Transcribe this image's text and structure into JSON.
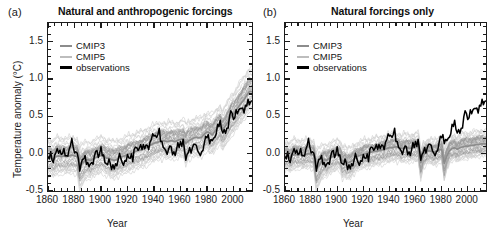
{
  "figure": {
    "width": 499,
    "height": 238,
    "background": "#ffffff"
  },
  "colors": {
    "cmip3": "#8c8c8c",
    "cmip5": "#bdbdbd",
    "observations": "#000000",
    "cmip3_spread": "#9a9a9a",
    "cmip5_spread": "#cfcfcf",
    "axis": "#1b1b1b",
    "text": "#1a1a1a"
  },
  "panels": [
    {
      "id": "a",
      "label": "(a)",
      "title": "Natural and anthropogenic forcings"
    },
    {
      "id": "b",
      "label": "(b)",
      "title": "Natural forcings only"
    }
  ],
  "axes": {
    "xlabel": "Year",
    "ylabel": "Temperature anomaly (°C)",
    "xlim": [
      1860,
      2014
    ],
    "ylim": [
      -0.5,
      1.75
    ],
    "xticks": [
      1860,
      1880,
      1900,
      1920,
      1940,
      1960,
      1980,
      2000
    ],
    "xtick_labels": [
      "1860",
      "1880",
      "1900",
      "1920",
      "1940",
      "1960",
      "1980",
      "2000"
    ],
    "xminor_step": 5,
    "yticks": [
      -0.5,
      0.0,
      0.5,
      1.0,
      1.5
    ],
    "ytick_labels": [
      "-0.5",
      "0.0",
      "0.5",
      "1.0",
      "1.5"
    ],
    "yminor_step": 0.1,
    "grid": false
  },
  "legend": {
    "position": "upper-left",
    "entries": [
      {
        "label": "CMIP3",
        "color": "#8c8c8c"
      },
      {
        "label": "CMIP5",
        "color": "#bdbdbd"
      },
      {
        "label": "observations",
        "color": "#000000"
      }
    ]
  },
  "chart_data": {
    "type": "line",
    "xlabel": "Year",
    "ylabel": "Temperature anomaly (°C)",
    "xlim": [
      1860,
      2014
    ],
    "ylim": [
      -0.5,
      1.75
    ],
    "grid": false,
    "legend_position": "upper-left",
    "note": "Anomalies relative to the 1880-1919 reference period. Shaded bands show the 5-95% range of the CMIP3 and CMIP5 multi-model ensembles.",
    "x": [
      1860,
      1862,
      1864,
      1866,
      1868,
      1870,
      1872,
      1874,
      1876,
      1878,
      1880,
      1882,
      1884,
      1886,
      1888,
      1890,
      1892,
      1894,
      1896,
      1898,
      1900,
      1902,
      1904,
      1906,
      1908,
      1910,
      1912,
      1914,
      1916,
      1918,
      1920,
      1922,
      1924,
      1926,
      1928,
      1930,
      1932,
      1934,
      1936,
      1938,
      1940,
      1942,
      1944,
      1946,
      1948,
      1950,
      1952,
      1954,
      1956,
      1958,
      1960,
      1962,
      1964,
      1966,
      1968,
      1970,
      1972,
      1974,
      1976,
      1978,
      1980,
      1982,
      1984,
      1986,
      1988,
      1990,
      1992,
      1994,
      1996,
      1998,
      2000,
      2002,
      2004,
      2006,
      2008,
      2010,
      2012
    ],
    "panels": [
      {
        "id": "a",
        "title": "Natural and anthropogenic forcings",
        "series": [
          {
            "name": "observations",
            "color": "#000000",
            "values": [
              -0.08,
              0.02,
              -0.14,
              0.05,
              0.02,
              -0.02,
              0.06,
              -0.05,
              0.04,
              0.18,
              0.02,
              0.01,
              -0.22,
              -0.09,
              -0.05,
              -0.17,
              -0.16,
              -0.14,
              0.03,
              -0.06,
              0.06,
              -0.07,
              -0.16,
              -0.08,
              -0.2,
              -0.21,
              -0.18,
              0.0,
              -0.16,
              -0.12,
              -0.05,
              -0.05,
              -0.08,
              0.1,
              0.04,
              0.06,
              0.06,
              0.08,
              0.06,
              0.19,
              0.22,
              0.18,
              0.28,
              0.1,
              0.04,
              -0.03,
              0.11,
              -0.02,
              -0.06,
              0.12,
              0.1,
              0.13,
              -0.08,
              0.02,
              0.0,
              0.11,
              0.06,
              -0.03,
              -0.04,
              0.14,
              0.23,
              0.15,
              0.14,
              0.21,
              0.33,
              0.38,
              0.28,
              0.29,
              0.33,
              0.58,
              0.43,
              0.53,
              0.57,
              0.6,
              0.55,
              0.67,
              0.68
            ]
          },
          {
            "name": "CMIP3",
            "color": "#8c8c8c",
            "values": [
              -0.06,
              -0.05,
              -0.08,
              -0.04,
              -0.03,
              -0.04,
              -0.03,
              -0.04,
              -0.03,
              -0.02,
              -0.03,
              -0.04,
              -0.16,
              -0.13,
              -0.09,
              -0.08,
              -0.09,
              -0.07,
              -0.05,
              -0.04,
              -0.02,
              -0.03,
              -0.06,
              -0.06,
              -0.08,
              -0.09,
              -0.08,
              -0.05,
              -0.04,
              -0.03,
              -0.01,
              0.0,
              0.01,
              0.03,
              0.04,
              0.05,
              0.06,
              0.08,
              0.1,
              0.12,
              0.14,
              0.15,
              0.16,
              0.17,
              0.17,
              0.16,
              0.17,
              0.17,
              0.16,
              0.18,
              0.19,
              0.2,
              0.14,
              0.17,
              0.19,
              0.21,
              0.22,
              0.21,
              0.22,
              0.26,
              0.29,
              0.28,
              0.25,
              0.3,
              0.35,
              0.38,
              0.33,
              0.37,
              0.43,
              0.5,
              0.53,
              0.58,
              0.63,
              0.68,
              0.72,
              0.78,
              0.83
            ]
          },
          {
            "name": "CMIP5",
            "color": "#bdbdbd",
            "values": [
              -0.05,
              -0.04,
              -0.07,
              -0.03,
              -0.02,
              -0.03,
              -0.02,
              -0.03,
              -0.02,
              -0.01,
              -0.02,
              -0.03,
              -0.18,
              -0.14,
              -0.1,
              -0.08,
              -0.09,
              -0.06,
              -0.04,
              -0.03,
              -0.01,
              -0.02,
              -0.05,
              -0.05,
              -0.07,
              -0.08,
              -0.07,
              -0.04,
              -0.03,
              -0.02,
              0.0,
              0.01,
              0.02,
              0.04,
              0.05,
              0.06,
              0.07,
              0.09,
              0.11,
              0.13,
              0.15,
              0.16,
              0.17,
              0.18,
              0.18,
              0.17,
              0.18,
              0.18,
              0.17,
              0.19,
              0.2,
              0.21,
              0.13,
              0.18,
              0.2,
              0.22,
              0.23,
              0.22,
              0.23,
              0.27,
              0.3,
              0.27,
              0.26,
              0.31,
              0.36,
              0.39,
              0.32,
              0.38,
              0.44,
              0.51,
              0.55,
              0.6,
              0.65,
              0.7,
              0.75,
              0.8,
              0.86
            ]
          }
        ],
        "spread": {
          "cmip5_lower": [
            -0.3,
            -0.29,
            -0.32,
            -0.28,
            -0.27,
            -0.28,
            -0.27,
            -0.28,
            -0.27,
            -0.26,
            -0.27,
            -0.28,
            -0.52,
            -0.46,
            -0.38,
            -0.33,
            -0.34,
            -0.31,
            -0.29,
            -0.28,
            -0.26,
            -0.27,
            -0.3,
            -0.3,
            -0.36,
            -0.34,
            -0.32,
            -0.29,
            -0.28,
            -0.27,
            -0.25,
            -0.24,
            -0.23,
            -0.21,
            -0.2,
            -0.19,
            -0.18,
            -0.16,
            -0.14,
            -0.12,
            -0.1,
            -0.09,
            -0.08,
            -0.07,
            -0.07,
            -0.08,
            -0.07,
            -0.07,
            -0.08,
            -0.06,
            -0.05,
            -0.04,
            -0.18,
            -0.09,
            -0.07,
            -0.05,
            -0.04,
            -0.05,
            -0.04,
            0.0,
            0.03,
            -0.04,
            -0.02,
            0.04,
            0.09,
            0.12,
            0.0,
            0.09,
            0.15,
            0.22,
            0.26,
            0.31,
            0.36,
            0.41,
            0.46,
            0.51,
            0.57
          ],
          "cmip5_upper": [
            0.2,
            0.21,
            0.18,
            0.22,
            0.23,
            0.22,
            0.23,
            0.22,
            0.23,
            0.24,
            0.23,
            0.22,
            0.1,
            0.13,
            0.16,
            0.18,
            0.17,
            0.2,
            0.22,
            0.23,
            0.25,
            0.24,
            0.21,
            0.21,
            0.19,
            0.18,
            0.19,
            0.22,
            0.23,
            0.24,
            0.26,
            0.27,
            0.28,
            0.3,
            0.31,
            0.32,
            0.33,
            0.35,
            0.37,
            0.39,
            0.41,
            0.42,
            0.43,
            0.44,
            0.44,
            0.43,
            0.44,
            0.44,
            0.43,
            0.45,
            0.46,
            0.47,
            0.4,
            0.45,
            0.47,
            0.49,
            0.5,
            0.49,
            0.5,
            0.54,
            0.57,
            0.53,
            0.52,
            0.58,
            0.63,
            0.66,
            0.58,
            0.65,
            0.71,
            0.79,
            0.84,
            0.89,
            0.95,
            1.0,
            1.06,
            1.11,
            1.18
          ]
        }
      },
      {
        "id": "b",
        "title": "Natural forcings only",
        "series": [
          {
            "name": "observations",
            "color": "#000000",
            "values": [
              -0.08,
              0.02,
              -0.14,
              0.05,
              0.02,
              -0.02,
              0.06,
              -0.05,
              0.04,
              0.18,
              0.02,
              0.01,
              -0.22,
              -0.09,
              -0.05,
              -0.17,
              -0.16,
              -0.14,
              0.03,
              -0.06,
              0.06,
              -0.07,
              -0.16,
              -0.08,
              -0.2,
              -0.21,
              -0.18,
              0.0,
              -0.16,
              -0.12,
              -0.05,
              -0.05,
              -0.08,
              0.1,
              0.04,
              0.06,
              0.06,
              0.08,
              0.06,
              0.19,
              0.22,
              0.18,
              0.28,
              0.1,
              0.04,
              -0.03,
              0.11,
              -0.02,
              -0.06,
              0.12,
              0.1,
              0.13,
              -0.08,
              0.02,
              0.0,
              0.11,
              0.06,
              -0.03,
              -0.04,
              0.14,
              0.23,
              0.15,
              0.14,
              0.21,
              0.33,
              0.38,
              0.28,
              0.29,
              0.33,
              0.58,
              0.43,
              0.53,
              0.57,
              0.6,
              0.55,
              0.67,
              0.68
            ]
          },
          {
            "name": "CMIP3",
            "color": "#8c8c8c",
            "values": [
              -0.04,
              -0.03,
              -0.06,
              -0.02,
              -0.01,
              -0.02,
              -0.01,
              -0.02,
              -0.01,
              0.0,
              -0.01,
              -0.02,
              -0.2,
              -0.16,
              -0.11,
              -0.08,
              -0.09,
              -0.06,
              -0.04,
              -0.03,
              -0.01,
              -0.02,
              -0.1,
              -0.09,
              -0.12,
              -0.11,
              -0.09,
              -0.05,
              -0.03,
              -0.02,
              -0.01,
              0.0,
              0.01,
              0.02,
              0.03,
              0.03,
              0.04,
              0.05,
              0.06,
              0.07,
              0.08,
              0.08,
              0.09,
              0.09,
              0.08,
              0.07,
              0.08,
              0.08,
              0.07,
              0.08,
              0.09,
              0.09,
              -0.12,
              -0.02,
              0.02,
              0.04,
              0.03,
              0.02,
              0.03,
              0.05,
              0.06,
              -0.13,
              -0.03,
              0.04,
              0.07,
              0.08,
              0.06,
              0.08,
              0.09,
              0.1,
              0.1,
              0.11,
              0.11,
              0.12,
              0.12,
              0.13,
              0.13
            ]
          },
          {
            "name": "CMIP5",
            "color": "#bdbdbd",
            "values": [
              -0.03,
              -0.02,
              -0.05,
              -0.01,
              0.0,
              -0.01,
              0.0,
              -0.01,
              0.0,
              0.01,
              0.0,
              -0.01,
              -0.22,
              -0.17,
              -0.12,
              -0.08,
              -0.09,
              -0.06,
              -0.04,
              -0.03,
              -0.01,
              -0.02,
              -0.11,
              -0.1,
              -0.13,
              -0.12,
              -0.09,
              -0.05,
              -0.03,
              -0.02,
              0.0,
              0.01,
              0.01,
              0.02,
              0.03,
              0.04,
              0.04,
              0.05,
              0.06,
              0.07,
              0.08,
              0.09,
              0.09,
              0.09,
              0.08,
              0.07,
              0.08,
              0.08,
              0.07,
              0.09,
              0.09,
              0.1,
              -0.14,
              -0.02,
              0.02,
              0.04,
              0.04,
              0.02,
              0.03,
              0.05,
              0.07,
              -0.15,
              -0.03,
              0.05,
              0.08,
              0.09,
              0.06,
              0.09,
              0.1,
              0.11,
              0.11,
              0.12,
              0.12,
              0.13,
              0.13,
              0.14,
              0.14
            ]
          }
        ],
        "spread": {
          "cmip5_lower": [
            -0.24,
            -0.23,
            -0.26,
            -0.22,
            -0.21,
            -0.22,
            -0.21,
            -0.22,
            -0.21,
            -0.2,
            -0.21,
            -0.22,
            -0.56,
            -0.48,
            -0.38,
            -0.31,
            -0.32,
            -0.28,
            -0.25,
            -0.24,
            -0.22,
            -0.23,
            -0.4,
            -0.36,
            -0.38,
            -0.35,
            -0.3,
            -0.25,
            -0.23,
            -0.22,
            -0.2,
            -0.19,
            -0.19,
            -0.18,
            -0.17,
            -0.16,
            -0.16,
            -0.15,
            -0.14,
            -0.13,
            -0.12,
            -0.11,
            -0.11,
            -0.11,
            -0.12,
            -0.13,
            -0.12,
            -0.12,
            -0.13,
            -0.11,
            -0.11,
            -0.1,
            -0.44,
            -0.26,
            -0.18,
            -0.16,
            -0.17,
            -0.18,
            -0.17,
            -0.15,
            -0.13,
            -0.48,
            -0.28,
            -0.16,
            -0.13,
            -0.12,
            -0.14,
            -0.12,
            -0.11,
            -0.1,
            -0.1,
            -0.09,
            -0.09,
            -0.08,
            -0.08,
            -0.07,
            -0.07
          ],
          "cmip5_upper": [
            0.16,
            0.17,
            0.14,
            0.18,
            0.19,
            0.18,
            0.19,
            0.18,
            0.19,
            0.2,
            0.19,
            0.18,
            0.02,
            0.06,
            0.1,
            0.14,
            0.13,
            0.16,
            0.18,
            0.19,
            0.2,
            0.19,
            0.08,
            0.09,
            0.07,
            0.08,
            0.11,
            0.15,
            0.17,
            0.18,
            0.19,
            0.2,
            0.21,
            0.22,
            0.22,
            0.23,
            0.23,
            0.24,
            0.25,
            0.26,
            0.27,
            0.28,
            0.28,
            0.28,
            0.27,
            0.26,
            0.27,
            0.27,
            0.26,
            0.28,
            0.29,
            0.29,
            -0.02,
            0.1,
            0.16,
            0.18,
            0.18,
            0.17,
            0.18,
            0.2,
            0.22,
            -0.04,
            0.1,
            0.19,
            0.22,
            0.23,
            0.21,
            0.24,
            0.25,
            0.26,
            0.26,
            0.27,
            0.27,
            0.28,
            0.28,
            0.29,
            0.29
          ]
        }
      }
    ]
  }
}
